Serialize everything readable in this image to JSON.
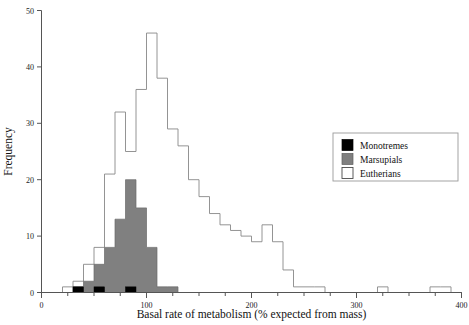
{
  "chart_data": {
    "type": "bar",
    "title": "",
    "subtitle": "",
    "xlabel": "Basal rate of metabolism (% expected from mass)",
    "ylabel": "Frequency",
    "xlim": [
      0,
      400
    ],
    "ylim": [
      0,
      50
    ],
    "xticks": [
      0,
      100,
      200,
      300,
      400
    ],
    "xticklabels": [
      "0",
      "100",
      "200",
      "300",
      "400"
    ],
    "yticks": [
      0,
      10,
      20,
      30,
      40,
      50
    ],
    "yticklabels": [
      "0",
      "10",
      "20",
      "30",
      "40",
      "50"
    ],
    "xminorticks": [
      25,
      50,
      75,
      125,
      150,
      175,
      225,
      250,
      275,
      325,
      350,
      375
    ],
    "grid": false,
    "bin_width": 10,
    "bin_starts": [
      0,
      10,
      20,
      30,
      40,
      50,
      60,
      70,
      80,
      90,
      100,
      110,
      120,
      130,
      140,
      150,
      160,
      170,
      180,
      190,
      200,
      210,
      220,
      230,
      240,
      250,
      260,
      270,
      280,
      290,
      300,
      310,
      320,
      330,
      340,
      350,
      360,
      370,
      380,
      390
    ],
    "legend": {
      "position": "right",
      "entries": [
        {
          "label": "Monotremes",
          "color": "#000000",
          "style": "filled-black"
        },
        {
          "label": "Marsupials",
          "color": "#808080",
          "style": "filled-gray"
        },
        {
          "label": "Eutherians",
          "color": "#ffffff",
          "style": "outline-white"
        }
      ]
    },
    "series": [
      {
        "name": "Eutherians",
        "note": "total stacked envelope (outline), value per 10-unit bin starting at bin_starts",
        "values": [
          0,
          0,
          1,
          2,
          5,
          8,
          21,
          32,
          25,
          36,
          46,
          38,
          29,
          26,
          20,
          17,
          14,
          12,
          11,
          10,
          9,
          12,
          9,
          4,
          1,
          1,
          1,
          0,
          0,
          0,
          0,
          0,
          1,
          0,
          0,
          0,
          0,
          1,
          1,
          0
        ]
      },
      {
        "name": "Marsupials",
        "note": "gray filled, value per 10-unit bin",
        "values": [
          0,
          0,
          0,
          1,
          2,
          5,
          8,
          13,
          20,
          15,
          8,
          1,
          1,
          0,
          0,
          0,
          0,
          0,
          0,
          0,
          0,
          0,
          0,
          0,
          0,
          0,
          0,
          0,
          0,
          0,
          0,
          0,
          0,
          0,
          0,
          0,
          0,
          0,
          0,
          0
        ]
      },
      {
        "name": "Monotremes",
        "note": "black filled, value per 10-unit bin",
        "values": [
          0,
          0,
          0,
          1,
          0,
          1,
          0,
          0,
          1,
          0,
          0,
          0,
          0,
          0,
          0,
          0,
          0,
          0,
          0,
          0,
          0,
          0,
          0,
          0,
          0,
          0,
          0,
          0,
          0,
          0,
          0,
          0,
          0,
          0,
          0,
          0,
          0,
          0,
          0,
          0
        ]
      }
    ]
  },
  "axes": {
    "y_title": "Frequency",
    "x_title": "Basal rate of metabolism (% expected from mass)"
  }
}
